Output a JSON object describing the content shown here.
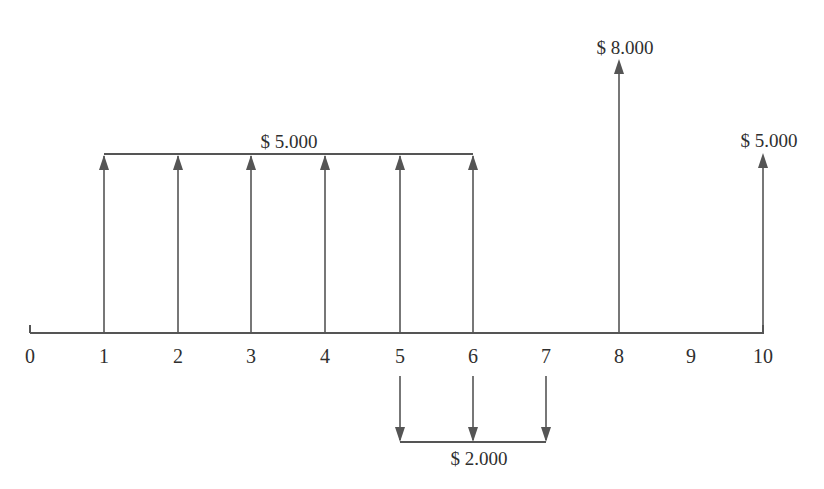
{
  "diagram": {
    "type": "cash-flow-timeline",
    "axis": {
      "periods": [
        "0",
        "1",
        "2",
        "3",
        "4",
        "5",
        "6",
        "7",
        "8",
        "9",
        "10"
      ]
    },
    "inflows": [
      {
        "label": "$ 5.000",
        "periods": [
          1,
          2,
          3,
          4,
          5,
          6
        ],
        "grouped": true
      },
      {
        "label": "$ 8.000",
        "periods": [
          8
        ],
        "grouped": false
      },
      {
        "label": "$ 5.000",
        "periods": [
          10
        ],
        "grouped": false
      }
    ],
    "outflows": [
      {
        "label": "$ 2.000",
        "periods": [
          5,
          6,
          7
        ],
        "grouped": true
      }
    ]
  },
  "labels": {
    "annuity_in": "$ 5.000",
    "single_in_8": "$ 8.000",
    "single_in_10": "$ 5.000",
    "annuity_out": "$ 2.000"
  },
  "colors": {
    "line": "#555555",
    "text": "#2f2f2f"
  }
}
